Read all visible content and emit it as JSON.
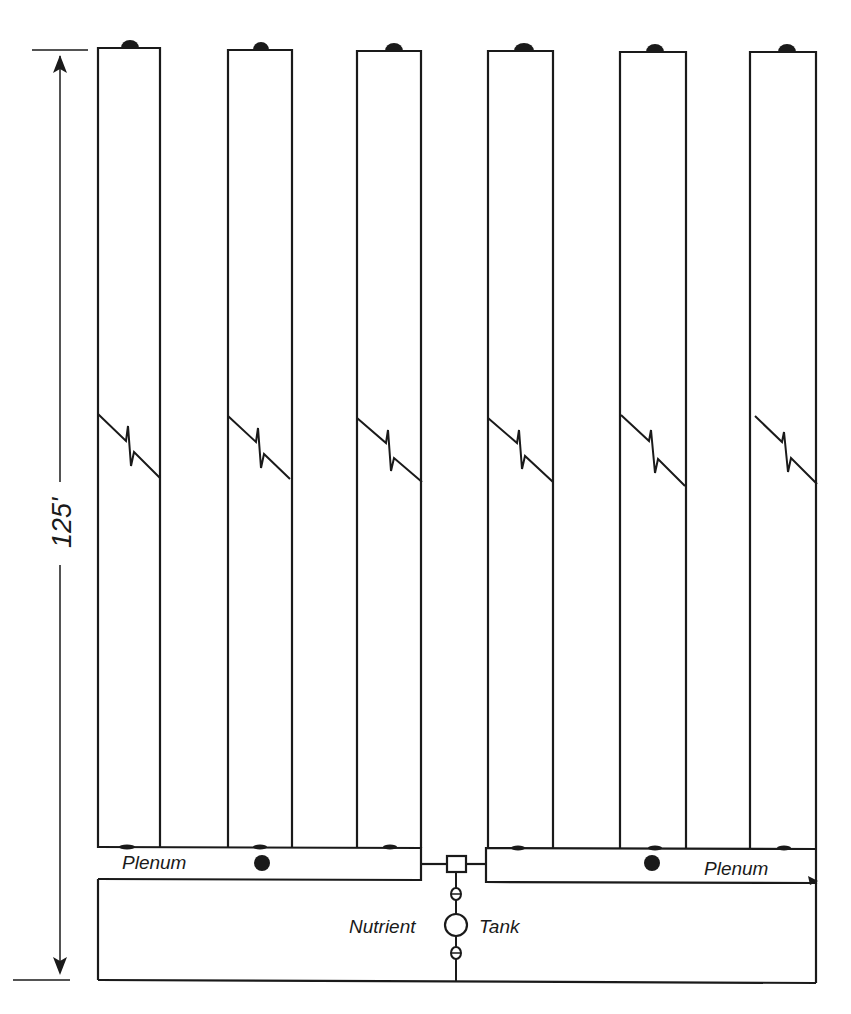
{
  "diagram": {
    "type": "hydroponic growing system layout (plan view)",
    "dimension": {
      "label": "125'",
      "x": 60,
      "y_top": 52,
      "y_bottom": 980
    },
    "channels": [
      {
        "id": 1,
        "x_left": 98,
        "x_right": 160,
        "top": 48,
        "cap_x": 130
      },
      {
        "id": 2,
        "x_left": 228,
        "x_right": 292,
        "top": 50,
        "cap_x": 261
      },
      {
        "id": 3,
        "x_left": 357,
        "x_right": 421,
        "top": 51,
        "cap_x": 394
      },
      {
        "id": 4,
        "x_left": 488,
        "x_right": 553,
        "top": 51,
        "cap_x": 523
      },
      {
        "id": 5,
        "x_left": 620,
        "x_right": 686,
        "top": 52,
        "cap_x": 655
      },
      {
        "id": 6,
        "x_left": 750,
        "x_right": 816,
        "top": 52,
        "cap_x": 787
      }
    ],
    "break_symbol_y": 415,
    "plenums": [
      {
        "label": "Plenum",
        "side": "left",
        "x1": 98,
        "x2": 421,
        "y1": 847,
        "y2": 880,
        "label_x": 122,
        "label_y": 867,
        "dot_x": 262,
        "dot_y": 863
      },
      {
        "label": "Plenum",
        "side": "right",
        "x1": 486,
        "x2": 816,
        "y1": 848,
        "y2": 883,
        "label_x": 704,
        "label_y": 872,
        "dot_x": 652,
        "dot_y": 863
      }
    ],
    "tank": {
      "label_left": "Nutrient",
      "label_right": "Tank",
      "x": 456,
      "valve_box_y": 862,
      "pump_y": 894,
      "valve_top_y": 866,
      "valve_bottom_y": 950
    },
    "frame": {
      "x_left": 98,
      "x_right": 816,
      "y_bottom": 980
    },
    "colors": {
      "line": "#1a1a1a",
      "background": "#ffffff"
    }
  }
}
